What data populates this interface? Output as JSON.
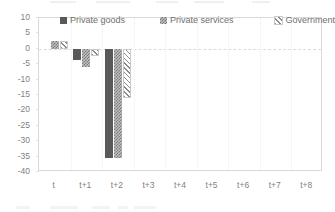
{
  "chart_data": {
    "type": "bar",
    "title": "",
    "subtitle": "",
    "xlabel": "",
    "ylabel": "",
    "categories": [
      "t",
      "t+1",
      "t+2",
      "t+3",
      "t+4",
      "t+5",
      "t+6",
      "t+7",
      "t+8"
    ],
    "series": [
      {
        "name": "Private goods",
        "pattern": "solid",
        "color": "#595959",
        "values": [
          0,
          -3.5,
          -35.5,
          null,
          null,
          null,
          null,
          null,
          null
        ]
      },
      {
        "name": "Private services",
        "pattern": "checkered",
        "color": "#bfbfbf",
        "values": [
          2.5,
          -6,
          -35.5,
          null,
          null,
          null,
          null,
          null,
          null
        ]
      },
      {
        "name": "Government",
        "pattern": "diagonal-hatch",
        "color": "#ffffff",
        "values": [
          2.5,
          -2.5,
          -16,
          null,
          null,
          null,
          null,
          null,
          null
        ]
      }
    ],
    "ylim": [
      -40,
      10
    ],
    "ytick_labels": [
      "10",
      "5",
      "0",
      "-5",
      "-10",
      "-15",
      "-20",
      "-25",
      "-30",
      "-35",
      "-40"
    ],
    "ytick_values": [
      10,
      5,
      0,
      -5,
      -10,
      -15,
      -20,
      -25,
      -30,
      -35,
      -40
    ],
    "grid": false,
    "zero_line": true,
    "legend_position": "top-inside"
  },
  "legend": {
    "items": [
      {
        "label": "Private goods",
        "swatch": "solid-square-icon"
      },
      {
        "label": "Private services",
        "swatch": "checkered-square-icon"
      },
      {
        "label": "Government",
        "swatch": "hatched-square-icon"
      }
    ]
  }
}
